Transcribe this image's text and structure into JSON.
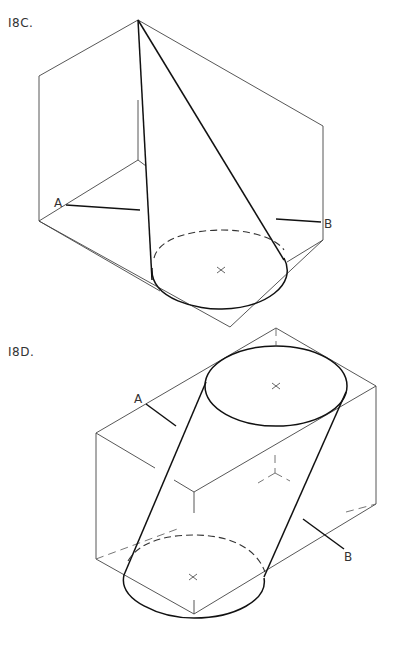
{
  "figures": [
    {
      "id": "18C",
      "label": "I8C.",
      "description": "Oblique cone inside rectangular box with cutting line A-B",
      "points": {
        "A": "A",
        "B": "B"
      }
    },
    {
      "id": "18D",
      "label": "I8D.",
      "description": "Oblique cylinder inside rectangular box with cutting line A-B",
      "points": {
        "A": "A",
        "B": "B"
      }
    }
  ]
}
